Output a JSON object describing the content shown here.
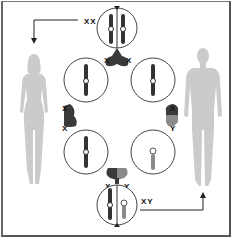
{
  "diagram": {
    "labels": {
      "female_karyotype": "XX",
      "male_karyotype": "XY",
      "top_join_left": "X",
      "top_join_right": "X",
      "left_join_top": "X",
      "left_join_bottom": "X",
      "right_join_top": "X",
      "right_join_bottom": "Y",
      "bottom_join_left": "X",
      "bottom_join_right": "Y"
    },
    "figures": [
      {
        "id": "female",
        "side": "left",
        "color": "#c8c8c8"
      },
      {
        "id": "male",
        "side": "right",
        "color": "#c8c8c8"
      }
    ],
    "cells": [
      {
        "id": "top",
        "contents": "two X chromosomes"
      },
      {
        "id": "upper-left",
        "contents": "single X chromosome"
      },
      {
        "id": "upper-right",
        "contents": "single X chromosome"
      },
      {
        "id": "lower-left",
        "contents": "single X chromosome"
      },
      {
        "id": "lower-right",
        "contents": "single Y chromosome"
      },
      {
        "id": "bottom",
        "contents": "X and Y chromosomes"
      }
    ],
    "colors": {
      "x_chromosome": "#333333",
      "y_chromosome": "#8a8a8a",
      "outline": "#444444"
    }
  }
}
